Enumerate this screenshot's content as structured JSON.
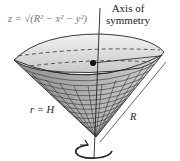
{
  "diagram": {
    "formula_label": "z = √(R² − x² − y²)",
    "axis_label_line1": "Axis of",
    "axis_label_line2": "symmetry",
    "left_label": "r = H",
    "slant_label": "R"
  },
  "colors": {
    "cap_fill": "#d4d4d4",
    "cone_fill": "#9a9a9a",
    "mesh_line": "#333333",
    "text": "#222222",
    "formula_text": "#777777"
  }
}
